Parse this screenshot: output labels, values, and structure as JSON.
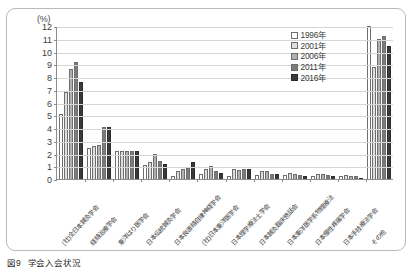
{
  "figure": {
    "caption_number": "図9",
    "caption_title": "学会入会状況",
    "unit_label": "(%)"
  },
  "legend": {
    "items": [
      {
        "label": "1996年",
        "color": "#ffffff"
      },
      {
        "label": "2001年",
        "color": "#dedede"
      },
      {
        "label": "2006年",
        "color": "#b0b0b0"
      },
      {
        "label": "2011年",
        "color": "#7c7c7c"
      },
      {
        "label": "2016年",
        "color": "#3a3a3a"
      }
    ]
  },
  "chart_data": {
    "type": "bar",
    "title": "学会入会状況",
    "xlabel": "",
    "ylabel": "(%)",
    "ylim": [
      0,
      12
    ],
    "ytick_labels": [
      "0",
      "1",
      "2",
      "3",
      "4",
      "5",
      "6",
      "7",
      "8",
      "9",
      "10",
      "11",
      "12"
    ],
    "grid": true,
    "legend_position": "top-right",
    "categories": [
      "(社)全日本鍼灸学会",
      "経絡治療学会",
      "東洋はり医学会",
      "日本伝統鍼灸学会",
      "日本良導絡自律神経学会",
      "(社)日本東洋医学会",
      "日本理学療法士学会",
      "日本鍼灸臨床懇話会",
      "日本東洋医学系物理療法",
      "日本慢性疼痛学会",
      "日本手技療法学会",
      "その他"
    ],
    "series": [
      {
        "name": "1996年",
        "values": [
          5.1,
          2.4,
          2.2,
          1.1,
          0.2,
          0.4,
          0.2,
          0.3,
          0.3,
          0.2,
          0.2,
          12.0
        ]
      },
      {
        "name": "2001年",
        "values": [
          6.8,
          2.6,
          2.2,
          1.3,
          0.6,
          0.8,
          0.8,
          0.6,
          0.5,
          0.4,
          0.3,
          8.8
        ]
      },
      {
        "name": "2006年",
        "values": [
          8.6,
          2.7,
          2.2,
          2.0,
          0.8,
          1.0,
          0.7,
          0.6,
          0.4,
          0.4,
          0.2,
          11.0
        ]
      },
      {
        "name": "2011年",
        "values": [
          9.2,
          4.1,
          2.2,
          1.4,
          0.9,
          0.6,
          0.8,
          0.4,
          0.3,
          0.3,
          0.2,
          11.2
        ]
      },
      {
        "name": "2016年",
        "values": [
          7.6,
          4.1,
          2.2,
          1.2,
          1.3,
          0.5,
          0.8,
          0.4,
          0.2,
          0.2,
          0.1,
          10.4
        ]
      }
    ]
  }
}
